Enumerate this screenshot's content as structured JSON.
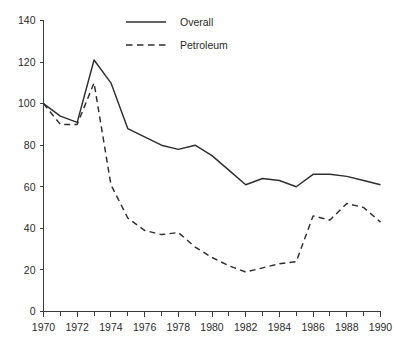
{
  "chart_data": {
    "type": "line",
    "title": "",
    "subtitle": "",
    "xlabel": "",
    "ylabel": "",
    "xlim": [
      1970,
      1990
    ],
    "ylim": [
      0,
      140
    ],
    "grid": false,
    "legend_position": "top-center",
    "x": [
      1970,
      1971,
      1972,
      1973,
      1974,
      1975,
      1976,
      1977,
      1978,
      1979,
      1980,
      1981,
      1982,
      1983,
      1984,
      1985,
      1986,
      1987,
      1988,
      1989,
      1990
    ],
    "x_tick_labels": [
      "1970",
      "1972",
      "1974",
      "1976",
      "1978",
      "1980",
      "1982",
      "1984",
      "1986",
      "1988",
      "1990"
    ],
    "x_ticks": [
      1970,
      1972,
      1974,
      1976,
      1978,
      1980,
      1982,
      1984,
      1986,
      1988,
      1990
    ],
    "x_minor_ticks": [
      1971,
      1973,
      1975,
      1977,
      1979,
      1981,
      1983,
      1985,
      1987,
      1989
    ],
    "y_ticks": [
      0,
      20,
      40,
      60,
      80,
      100,
      120,
      140
    ],
    "y_tick_labels": [
      "0",
      "20",
      "40",
      "60",
      "80",
      "100",
      "120",
      "140"
    ],
    "series": [
      {
        "name": "Overall",
        "style": "solid",
        "color": "#2e2e2e",
        "values": [
          100,
          94,
          91,
          121,
          110,
          88,
          84,
          80,
          78,
          80,
          75,
          68,
          61,
          64,
          63,
          60,
          66,
          66,
          65,
          63,
          61
        ]
      },
      {
        "name": "Petroleum",
        "style": "dashed",
        "color": "#2e2e2e",
        "values": [
          100,
          90,
          90,
          110,
          61,
          45,
          39,
          37,
          38,
          31,
          26,
          22,
          19,
          21,
          23,
          24,
          46,
          44,
          52,
          50,
          43
        ]
      }
    ]
  },
  "legend": {
    "entries": [
      {
        "label": "Overall",
        "style": "solid"
      },
      {
        "label": "Petroleum",
        "style": "dashed"
      }
    ]
  }
}
